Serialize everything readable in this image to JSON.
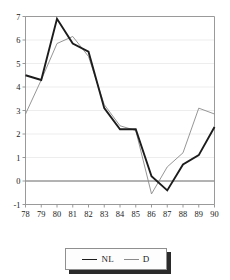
{
  "chart_data": {
    "type": "line",
    "title": "",
    "xlabel": "",
    "ylabel": "",
    "x": [
      "78",
      "79",
      "80",
      "81",
      "82",
      "83",
      "84",
      "85",
      "86",
      "87",
      "88",
      "89",
      "90"
    ],
    "categories": [
      "78",
      "79",
      "80",
      "81",
      "82",
      "83",
      "84",
      "85",
      "86",
      "87",
      "88",
      "89",
      "90"
    ],
    "ylim": [
      -1,
      7
    ],
    "yticks": [
      -1,
      0,
      1,
      2,
      3,
      4,
      5,
      6,
      7
    ],
    "ytick_labels": [
      "-1",
      "0",
      "1",
      "2",
      "3",
      "4",
      "5",
      "6",
      "7"
    ],
    "grid": "horizontal",
    "zero_line": true,
    "legend_position": "bottom-center",
    "series": [
      {
        "name": "NL",
        "color": "#1c1c1c",
        "width": 1.9,
        "values": [
          4.5,
          4.3,
          6.9,
          5.85,
          5.5,
          3.1,
          2.2,
          2.2,
          0.2,
          -0.4,
          0.7,
          1.1,
          2.3
        ]
      },
      {
        "name": "D",
        "color": "#8a8a8a",
        "width": 0.9,
        "values": [
          2.85,
          4.3,
          5.85,
          6.15,
          5.3,
          3.25,
          2.35,
          2.15,
          -0.55,
          0.6,
          1.2,
          3.1,
          2.85
        ]
      }
    ]
  },
  "legend": {
    "entries": [
      {
        "label": "NL"
      },
      {
        "label": "D"
      }
    ]
  },
  "colors": {
    "nl_line": "#1c1c1c",
    "d_line": "#8a8a8a",
    "frame": "#8f8f8f",
    "grid": "#e9e9e9",
    "zero_axis": "#555555",
    "text": "#1a1a1a"
  }
}
